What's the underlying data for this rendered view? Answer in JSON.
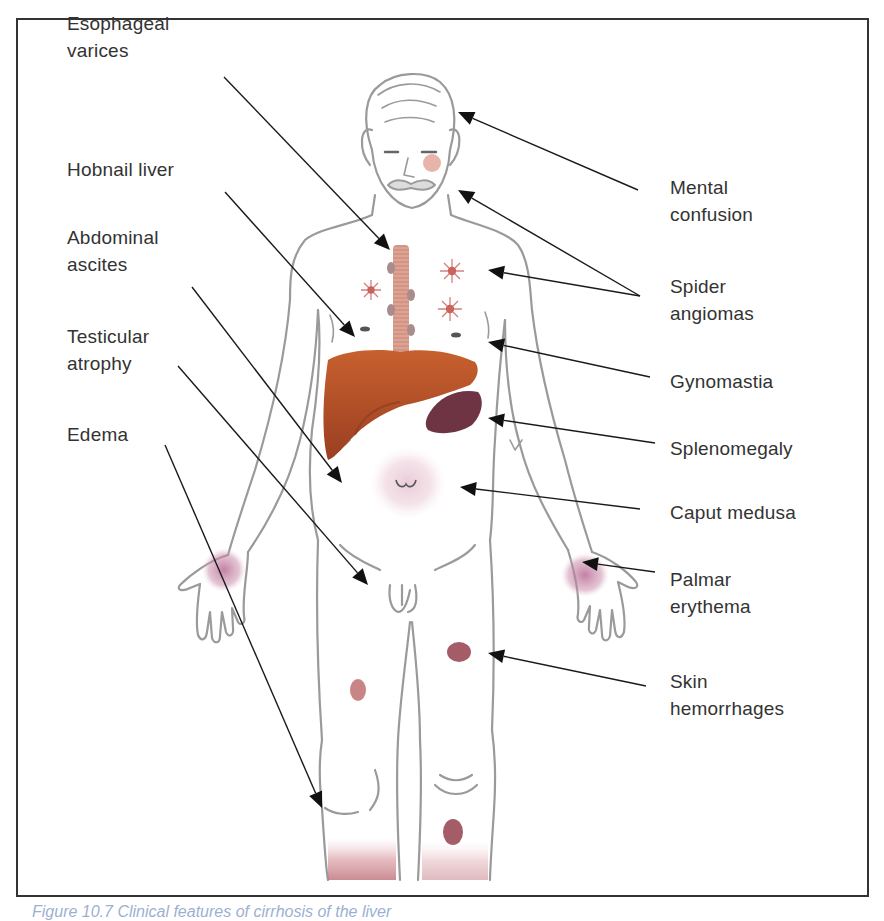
{
  "figure": {
    "caption": "Figure 10.7 Clinical features of cirrhosis of the liver",
    "colors": {
      "frame": "#333333",
      "text": "#333333",
      "outline": "#9a9a9a",
      "liver": "#b5532a",
      "spleen": "#6e3444",
      "erythema": "#c88aa8",
      "hemorrhage": "#9a4a55",
      "esophagus": "#d99a8a",
      "caption": "#4a6fb0"
    },
    "labels_left": [
      {
        "id": "esophageal-varices",
        "text": "Esophageal\nvarices",
        "x": 67,
        "y": 10
      },
      {
        "id": "hobnail-liver",
        "text": "Hobnail liver",
        "x": 67,
        "y": 156
      },
      {
        "id": "abdominal-ascites",
        "text": "Abdominal\nascites",
        "x": 67,
        "y": 224
      },
      {
        "id": "testicular-atrophy",
        "text": "Testicular\natrophy",
        "x": 67,
        "y": 323
      },
      {
        "id": "edema",
        "text": "Edema",
        "x": 67,
        "y": 421
      }
    ],
    "labels_right": [
      {
        "id": "mental-confusion",
        "text": "Mental\nconfusion",
        "x": 670,
        "y": 174
      },
      {
        "id": "spider-angiomas",
        "text": "Spider\nangiomas",
        "x": 670,
        "y": 273
      },
      {
        "id": "gynomastia",
        "text": "Gynomastia",
        "x": 670,
        "y": 368
      },
      {
        "id": "splenomegaly",
        "text": "Splenomegaly",
        "x": 670,
        "y": 435
      },
      {
        "id": "caput-medusa",
        "text": "Caput medusa",
        "x": 670,
        "y": 499
      },
      {
        "id": "palmar-erythema",
        "text": "Palmar\nerythema",
        "x": 670,
        "y": 566
      },
      {
        "id": "skin-hemorrhages",
        "text": "Skin\nhemorrhages",
        "x": 670,
        "y": 668
      }
    ],
    "arrows": [
      {
        "label": "Esophageal varices",
        "from": [
          224,
          77
        ],
        "to": [
          390,
          250
        ]
      },
      {
        "label": "Hobnail liver",
        "from": [
          225,
          192
        ],
        "to": [
          355,
          337
        ]
      },
      {
        "label": "Abdominal ascites",
        "from": [
          192,
          287
        ],
        "to": [
          342,
          483
        ]
      },
      {
        "label": "Testicular atrophy",
        "from": [
          178,
          366
        ],
        "to": [
          368,
          585
        ]
      },
      {
        "label": "Edema",
        "from": [
          165,
          445
        ],
        "to": [
          322,
          808
        ]
      },
      {
        "label": "Mental confusion",
        "from": [
          638,
          190
        ],
        "to": [
          458,
          112
        ]
      },
      {
        "label": "Spider angiomas (face)",
        "from": [
          640,
          296
        ],
        "to": [
          458,
          190
        ]
      },
      {
        "label": "Spider angiomas (chest)",
        "from": [
          640,
          296
        ],
        "to": [
          488,
          270
        ]
      },
      {
        "label": "Gynomastia",
        "from": [
          650,
          377
        ],
        "to": [
          488,
          342
        ]
      },
      {
        "label": "Splenomegaly",
        "from": [
          655,
          443
        ],
        "to": [
          488,
          418
        ]
      },
      {
        "label": "Caput medusa",
        "from": [
          640,
          509
        ],
        "to": [
          460,
          487
        ]
      },
      {
        "label": "Palmar erythema",
        "from": [
          655,
          572
        ],
        "to": [
          582,
          562
        ]
      },
      {
        "label": "Skin hemorrhages",
        "from": [
          646,
          686
        ],
        "to": [
          488,
          653
        ]
      }
    ]
  }
}
